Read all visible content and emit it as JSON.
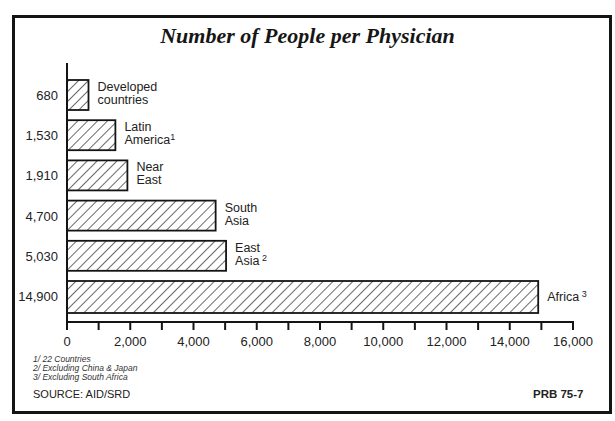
{
  "chart_data": {
    "type": "bar",
    "orientation": "horizontal",
    "title": "Number of People per Physician",
    "xlabel": "",
    "ylabel": "",
    "categories": [
      "Developed countries",
      "Latin America",
      "Near East",
      "South Asia",
      "East Asia",
      "Africa"
    ],
    "category_footnotes": [
      "",
      "1",
      "",
      "",
      "2",
      "3"
    ],
    "value_labels": [
      "680",
      "1,530",
      "1,910",
      "4,700",
      "5,030",
      "14,900"
    ],
    "values": [
      680,
      1530,
      1910,
      4700,
      5030,
      14900
    ],
    "xlim": [
      0,
      16000
    ],
    "xticks": [
      "0",
      "2,000",
      "4,000",
      "6,000",
      "8,000",
      "10,000",
      "12,000",
      "14,000",
      "16,000"
    ],
    "minor_tick_step": 1000,
    "grid": false,
    "bar_fill": "diagonal hatch",
    "footnotes": [
      "1/ 22 Countries",
      "2/ Excluding China & Japan",
      "3/ Excluding South Africa"
    ],
    "source": "SOURCE: AID/SRD",
    "code": "PRB 75-7"
  },
  "colors": {
    "ink": "#161616",
    "background": "#ffffff"
  }
}
